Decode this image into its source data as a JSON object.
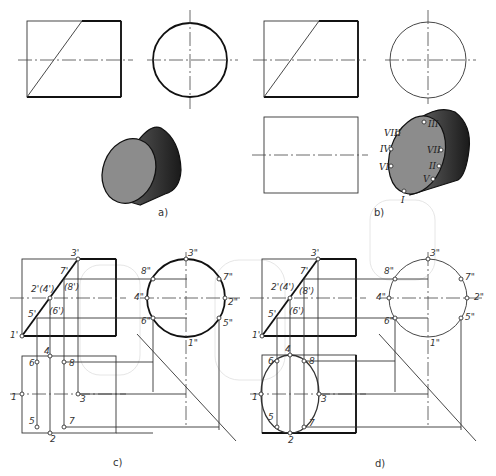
{
  "figure": {
    "panels": [
      {
        "id": "a",
        "caption": "a)"
      },
      {
        "id": "b",
        "caption": "b)"
      },
      {
        "id": "c",
        "caption": "c)"
      },
      {
        "id": "d",
        "caption": "d)"
      }
    ],
    "panel_b_roman_labels": [
      "I",
      "II",
      "III",
      "IV",
      "V",
      "VI",
      "VII",
      "VIII"
    ],
    "panel_c_front_labels": [
      "1'",
      "2'(4')",
      "3'",
      "5'",
      "(6')",
      "7'",
      "(8')"
    ],
    "panel_c_side_labels": [
      "1\"",
      "2\"",
      "3\"",
      "4\"",
      "5\"",
      "6\"",
      "7\"",
      "8\""
    ],
    "panel_c_top_labels": [
      "1",
      "2",
      "3",
      "4",
      "5",
      "6",
      "7",
      "8"
    ],
    "panel_d_front_labels": [
      "1'",
      "2'(4')",
      "3'",
      "5'",
      "(6')",
      "7'",
      "(8')"
    ],
    "panel_d_side_labels": [
      "1\"",
      "2\"",
      "3\"",
      "4\"",
      "5\"",
      "6\"",
      "7\"",
      "8\""
    ],
    "panel_d_top_labels": [
      "1",
      "2",
      "3",
      "4",
      "5",
      "6",
      "7",
      "8"
    ]
  },
  "colors": {
    "line": "#111111",
    "thin_line": "#333333",
    "cylinder_face": "#8c8c8c",
    "cylinder_side_dark": "#2a2a2a",
    "background": "#ffffff"
  }
}
